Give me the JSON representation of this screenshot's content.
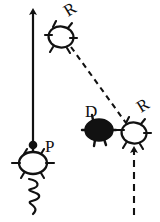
{
  "figure": {
    "title": "",
    "background_color": "#ffffff",
    "ink_color": "#111111",
    "width": 160,
    "height": 222
  },
  "labels": {
    "receptor_top": "R",
    "receptor_bottom_right": "R",
    "drug": "D",
    "protein": "P"
  },
  "nodes": [
    {
      "id": "receptor-top",
      "label": "R",
      "kind": "open-circle-with-spikes",
      "cx": 61,
      "cy": 37,
      "rx": 13,
      "ry": 11,
      "label_x": 68,
      "label_y": 14,
      "label_rotation": -35,
      "filled": false
    },
    {
      "id": "drug",
      "label": "D",
      "kind": "filled-ellipse-with-spikes",
      "cx": 99,
      "cy": 130,
      "rx": 14,
      "ry": 11,
      "label_x": 88,
      "label_y": 115,
      "label_rotation": 0,
      "filled": true
    },
    {
      "id": "receptor-bottom-right",
      "label": "R",
      "kind": "open-circle-with-spikes",
      "cx": 134,
      "cy": 133,
      "rx": 13,
      "ry": 11,
      "label_x": 141,
      "label_y": 111,
      "label_rotation": -35,
      "filled": false
    },
    {
      "id": "protein",
      "label": "P",
      "kind": "open-circle-with-spikes",
      "cx": 33,
      "cy": 163,
      "rx": 14,
      "ry": 11,
      "label_x": 48,
      "label_y": 150,
      "label_rotation": 0,
      "filled": false
    }
  ],
  "connectors": [
    {
      "id": "response-arrow",
      "style": "solid",
      "has_arrowhead": true,
      "from_x": 33,
      "from_y": 146,
      "to_x": 33,
      "to_y": 9
    },
    {
      "id": "receptor-link",
      "style": "dashed",
      "has_arrowhead": false,
      "from_x": 71,
      "from_y": 47,
      "to_x": 126,
      "to_y": 123
    },
    {
      "id": "stimulus-arrow",
      "style": "dashed",
      "has_arrowhead": true,
      "from_x": 134,
      "from_y": 215,
      "to_x": 134,
      "to_y": 147
    }
  ],
  "decorations": [
    {
      "id": "signal-dot",
      "kind": "filled-dot",
      "cx": 33,
      "cy": 145,
      "r": 4
    },
    {
      "id": "coiled-tail",
      "kind": "squiggle",
      "x": 33,
      "y_start": 176,
      "y_end": 214,
      "amplitude": 7,
      "waves": 3
    }
  ]
}
